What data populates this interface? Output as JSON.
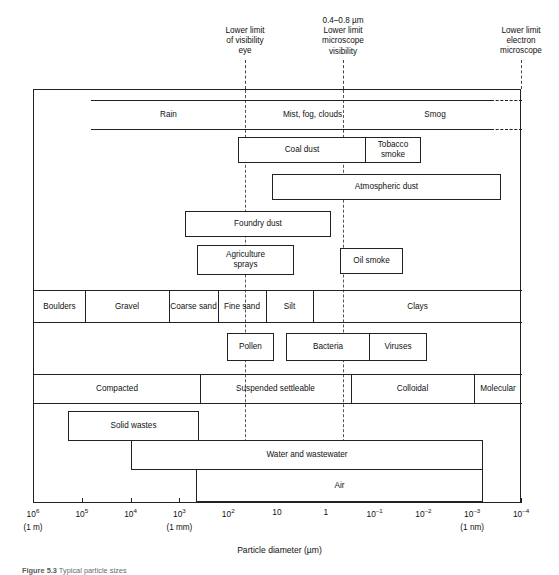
{
  "figure": {
    "axis_title": "Particle diameter (µm)",
    "caption_label": "Figure 5.3",
    "caption_text": "Typical particle sizes"
  },
  "callouts": [
    {
      "name": "visibility-eye",
      "text": "Lower limit\nof visibility\neye",
      "x_um": 40,
      "label_x": 245,
      "label_top": 26
    },
    {
      "name": "microscope-visibility",
      "text": "0.4–0.8 µm\nLower limit\nmicroscope\nvisibility",
      "x_um": 0.6,
      "label_x": 343,
      "label_top": 16
    },
    {
      "name": "electron-microscope",
      "text": "Lower limit\nelectron\nmicroscope",
      "x_um": 0.0001,
      "label_x": 521,
      "label_top": 26
    }
  ],
  "axis": {
    "ticks": [
      {
        "label": "10",
        "exp": "6",
        "unit": "(1 m)"
      },
      {
        "label": "10",
        "exp": "5",
        "unit": ""
      },
      {
        "label": "10",
        "exp": "4",
        "unit": ""
      },
      {
        "label": "10",
        "exp": "3",
        "unit": "(1 mm)"
      },
      {
        "label": "10",
        "exp": "2",
        "unit": ""
      },
      {
        "label": "10",
        "exp": "",
        "unit": ""
      },
      {
        "label": "1",
        "exp": "",
        "unit": ""
      },
      {
        "label": "10",
        "exp": "–1",
        "unit": ""
      },
      {
        "label": "10",
        "exp": "–2",
        "unit": ""
      },
      {
        "label": "10",
        "exp": "–3",
        "unit": "(1 nm)"
      },
      {
        "label": "10",
        "exp": "–4",
        "unit": ""
      }
    ]
  },
  "chart_data": {
    "type": "table",
    "title": "Typical particle sizes",
    "xlabel": "Particle diameter (µm)",
    "ylabel": "",
    "xscale": "log",
    "xlim": [
      1000000,
      0.0001
    ],
    "grid": false,
    "legend": "none",
    "rows": [
      {
        "name": "meteorological-band",
        "style": "band",
        "dashed_right_end": true,
        "segments": [
          {
            "label": "Rain",
            "from_um": 100000,
            "to_um": 400
          },
          {
            "label": "Mist, fog, clouds",
            "from_um": 400,
            "to_um": 2
          },
          {
            "label": "Smog",
            "from_um": 2,
            "to_um": 0.005
          }
        ]
      },
      {
        "name": "coal-tobacco-group",
        "style": "box-group",
        "segments": [
          {
            "label": "Coal dust",
            "from_um": 70,
            "to_um": 1.2
          },
          {
            "label": "Tobacco smoke",
            "from_um": 1.2,
            "to_um": 0.07
          }
        ]
      },
      {
        "name": "atmospheric-dust-box",
        "style": "box",
        "segments": [
          {
            "label": "Atmospheric dust",
            "from_um": 25,
            "to_um": 0.012
          }
        ]
      },
      {
        "name": "foundry-dust-box",
        "style": "box",
        "segments": [
          {
            "label": "Foundry dust",
            "from_um": 1600,
            "to_um": 4
          }
        ]
      },
      {
        "name": "agriculture-sprays-box",
        "style": "box",
        "segments": [
          {
            "label": "Agriculture\nsprays",
            "from_um": 900,
            "to_um": 13
          }
        ]
      },
      {
        "name": "oil-smoke-box",
        "style": "box",
        "segments": [
          {
            "label": "Oil smoke",
            "from_um": 1.2,
            "to_um": 0.06
          }
        ]
      },
      {
        "name": "soil-classification-band",
        "style": "band",
        "segments": [
          {
            "label": "Boulders",
            "from_um": 1000000,
            "to_um": 150000
          },
          {
            "label": "Gravel",
            "from_um": 150000,
            "to_um": 2000
          },
          {
            "label": "Coarse\nsand",
            "from_um": 2000,
            "to_um": 200
          },
          {
            "label": "Fine\nsand",
            "from_um": 200,
            "to_um": 50
          },
          {
            "label": "Silt",
            "from_um": 50,
            "to_um": 6
          },
          {
            "label": "Clays",
            "from_um": 6,
            "to_um": 0.0002
          }
        ]
      },
      {
        "name": "pollen-box",
        "style": "box",
        "segments": [
          {
            "label": "Pollen",
            "from_um": 80,
            "to_um": 13
          }
        ]
      },
      {
        "name": "bacteria-viruses-group",
        "style": "box-group",
        "segments": [
          {
            "label": "Bacteria",
            "from_um": 9,
            "to_um": 0.45
          },
          {
            "label": "Viruses",
            "from_um": 0.45,
            "to_um": 0.03
          }
        ]
      },
      {
        "name": "water-classification-band",
        "style": "band",
        "segments": [
          {
            "label": "Compacted",
            "from_um": 100000,
            "to_um": 130
          },
          {
            "label": "Suspended settleable",
            "from_um": 130,
            "to_um": 0.35
          },
          {
            "label": "Colloidal",
            "from_um": 0.35,
            "to_um": 0.0017
          },
          {
            "label": "Molecular",
            "from_um": 0.0017,
            "to_um": 0.0002
          }
        ]
      },
      {
        "name": "solid-wastes-box",
        "style": "box",
        "segments": [
          {
            "label": "Solid wastes",
            "from_um": 90000,
            "to_um": 350
          }
        ]
      },
      {
        "name": "water-and-wastewater-box",
        "style": "box",
        "segments": [
          {
            "label": "Water and wastewater",
            "from_um": 10000,
            "to_um": 0.0013
          }
        ]
      },
      {
        "name": "air-box",
        "style": "box",
        "segments": [
          {
            "label": "Air",
            "from_um": 900,
            "to_um": 0.0013
          }
        ]
      }
    ]
  }
}
